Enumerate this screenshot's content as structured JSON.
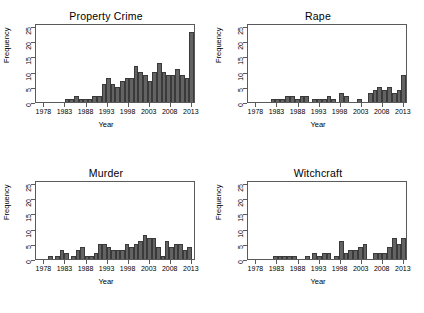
{
  "figure": {
    "axis_title_x": "Year",
    "axis_title_y": "Frequency",
    "bar_color": "#636363",
    "bar_border_color": "#3a3a3a",
    "frame_color": "#5a5a5a",
    "background": "#ffffff"
  },
  "axes": {
    "ylim": [
      0,
      26
    ],
    "yticks": [
      0,
      5,
      10,
      15,
      20,
      25
    ],
    "ytick_labels": [
      "0",
      "5",
      "10",
      "15",
      "20",
      "25"
    ],
    "xlim": [
      1976,
      2014
    ],
    "xticks": [
      1978,
      1983,
      1988,
      1993,
      1998,
      2003,
      2008,
      2013
    ],
    "xtick_labels": [
      "1978",
      "1983",
      "1988",
      "1993",
      "1998",
      "2003",
      "2008",
      "2013"
    ]
  },
  "chart_data": [
    {
      "type": "bar",
      "title": "Property Crime",
      "xlabel": "Year",
      "ylabel": "Frequency",
      "ylim": [
        0,
        26
      ],
      "xlim": [
        1976,
        2014
      ],
      "grid": false,
      "legend": null,
      "categories": [
        1977,
        1978,
        1979,
        1980,
        1981,
        1982,
        1983,
        1984,
        1985,
        1986,
        1987,
        1988,
        1989,
        1990,
        1991,
        1992,
        1993,
        1994,
        1995,
        1996,
        1997,
        1998,
        1999,
        2000,
        2001,
        2002,
        2003,
        2004,
        2005,
        2006,
        2007,
        2008,
        2009,
        2010,
        2011,
        2012,
        2013
      ],
      "values": [
        0,
        0,
        0,
        0,
        0,
        0,
        0,
        0,
        0,
        0,
        1,
        1,
        2,
        1,
        1,
        1,
        2,
        2,
        6,
        8,
        6,
        5,
        7,
        8,
        8,
        12,
        10,
        9,
        7,
        10,
        13,
        10,
        9,
        9,
        11,
        9,
        8,
        23
      ]
    },
    {
      "type": "bar",
      "title": "Rape",
      "xlabel": "Year",
      "ylabel": "Frequency",
      "ylim": [
        0,
        26
      ],
      "xlim": [
        1976,
        2014
      ],
      "grid": false,
      "legend": null,
      "categories": [
        1977,
        1978,
        1979,
        1980,
        1981,
        1982,
        1983,
        1984,
        1985,
        1986,
        1987,
        1988,
        1989,
        1990,
        1991,
        1992,
        1993,
        1994,
        1995,
        1996,
        1997,
        1998,
        1999,
        2000,
        2001,
        2002,
        2003,
        2004,
        2005,
        2006,
        2007,
        2008,
        2009,
        2010,
        2011,
        2012,
        2013
      ],
      "values": [
        0,
        0,
        0,
        0,
        0,
        0,
        0,
        1,
        1,
        1,
        2,
        2,
        1,
        2,
        2,
        0,
        1,
        1,
        1,
        2,
        1,
        0,
        3,
        2,
        0,
        0,
        0,
        1,
        0,
        0,
        3,
        4,
        5,
        4,
        5,
        3,
        4,
        9
      ]
    },
    {
      "type": "bar",
      "title": "Murder",
      "xlabel": "Year",
      "ylabel": "Frequency",
      "ylim": [
        0,
        26
      ],
      "xlim": [
        1976,
        2014
      ],
      "grid": false,
      "legend": null,
      "categories": [
        1977,
        1978,
        1979,
        1980,
        1981,
        1982,
        1983,
        1984,
        1985,
        1986,
        1987,
        1988,
        1989,
        1990,
        1991,
        1992,
        1993,
        1994,
        1995,
        1996,
        1997,
        1998,
        1999,
        2000,
        2001,
        2002,
        2003,
        2004,
        2005,
        2006,
        2007,
        2008,
        2009,
        2010,
        2011,
        2012,
        2013
      ],
      "values": [
        0,
        0,
        0,
        0,
        1,
        0,
        1,
        3,
        2,
        0,
        1,
        3,
        4,
        1,
        1,
        2,
        5,
        5,
        4,
        3,
        3,
        3,
        5,
        4,
        5,
        6,
        8,
        7,
        7,
        4,
        1,
        6,
        4,
        5,
        5,
        3,
        4,
        0
      ]
    },
    {
      "type": "bar",
      "title": "Witchcraft",
      "xlabel": "Year",
      "ylabel": "Frequency",
      "ylim": [
        0,
        26
      ],
      "xlim": [
        1976,
        2014
      ],
      "grid": false,
      "legend": null,
      "categories": [
        1977,
        1978,
        1979,
        1980,
        1981,
        1982,
        1983,
        1984,
        1985,
        1986,
        1987,
        1988,
        1989,
        1990,
        1991,
        1992,
        1993,
        1994,
        1995,
        1996,
        1997,
        1998,
        1999,
        2000,
        2001,
        2002,
        2003,
        2004,
        2005,
        2006,
        2007,
        2008,
        2009,
        2010,
        2011,
        2012,
        2013
      ],
      "values": [
        0,
        0,
        0,
        0,
        0,
        0,
        0,
        0,
        1,
        1,
        1,
        1,
        1,
        0,
        0,
        0,
        1,
        0,
        2,
        1,
        2,
        2,
        0,
        1,
        6,
        2,
        3,
        3,
        4,
        5,
        0,
        0,
        2,
        2,
        2,
        4,
        7,
        5,
        7
      ]
    }
  ]
}
